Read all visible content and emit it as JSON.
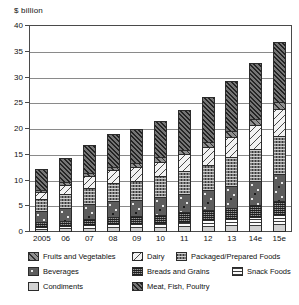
{
  "chart_data": {
    "type": "bar",
    "stacked": true,
    "title": "",
    "ylabel": "$ billion",
    "xlabel": "",
    "ylim": [
      0,
      40
    ],
    "yticks": [
      0,
      5,
      10,
      15,
      20,
      25,
      30,
      35,
      40
    ],
    "grid": true,
    "legend_position": "bottom",
    "categories": [
      "2005",
      "06",
      "07",
      "08",
      "09",
      "10",
      "11",
      "12",
      "13",
      "14e",
      "15e"
    ],
    "series": [
      {
        "name": "Condiments",
        "pattern": "solid-light-grey",
        "values": [
          0.4,
          0.5,
          0.6,
          0.7,
          0.7,
          0.8,
          0.9,
          1.0,
          1.1,
          1.2,
          1.4
        ]
      },
      {
        "name": "Snack Foods",
        "pattern": "horizontal-lines",
        "values": [
          0.5,
          0.6,
          0.7,
          0.8,
          0.9,
          1.0,
          1.1,
          1.3,
          1.5,
          1.7,
          2.0
        ]
      },
      {
        "name": "Breads and Grains",
        "pattern": "dense-cross-hatch-dark",
        "values": [
          1.0,
          1.1,
          1.3,
          1.4,
          1.5,
          1.6,
          1.8,
          1.9,
          2.1,
          2.3,
          2.6
        ]
      },
      {
        "name": "Beverages",
        "pattern": "dark-with-dots",
        "values": [
          2.1,
          2.4,
          2.8,
          3.1,
          3.2,
          3.4,
          3.6,
          3.9,
          4.3,
          4.7,
          5.3
        ]
      },
      {
        "name": "Packaged/Prepared Foods",
        "pattern": "mid-grey-cross-dots",
        "values": [
          2.4,
          2.8,
          3.2,
          3.5,
          3.7,
          4.0,
          4.4,
          4.9,
          5.5,
          6.3,
          7.3
        ]
      },
      {
        "name": "Dairy",
        "pattern": "white-back-diagonal",
        "values": [
          1.4,
          1.8,
          2.2,
          2.5,
          2.7,
          2.9,
          3.3,
          3.5,
          3.9,
          4.5,
          5.2
        ]
      },
      {
        "name": "Fruits and Vegetables",
        "pattern": "grey-forward-diagonal",
        "values": [
          0.4,
          0.5,
          0.6,
          0.7,
          0.8,
          0.8,
          0.9,
          1.0,
          1.2,
          1.3,
          1.5
        ]
      },
      {
        "name": "Meat, Fish, Poultry",
        "pattern": "dark-dense-diagonal",
        "values": [
          4.1,
          4.7,
          5.6,
          6.3,
          6.5,
          7.1,
          7.7,
          8.8,
          9.8,
          10.9,
          11.7
        ]
      }
    ],
    "totals": [
      12.3,
      14.4,
      17.0,
      19.0,
      20.0,
      21.6,
      23.7,
      26.3,
      29.4,
      32.9,
      37.0
    ]
  },
  "legend": {
    "rows": [
      [
        {
          "label": "Fruits and Vegetables",
          "key": "fruits"
        },
        {
          "label": "Dairy",
          "key": "dairy"
        },
        {
          "label": "Packaged/Prepared Foods",
          "key": "packaged"
        }
      ],
      [
        {
          "label": "Beverages",
          "key": "beverages"
        },
        {
          "label": "Breads and Grains",
          "key": "breads"
        },
        {
          "label": "Snack Foods",
          "key": "snack"
        }
      ],
      [
        {
          "label": "Condiments",
          "key": "condiments"
        },
        {
          "label": "Meat, Fish, Poultry",
          "key": "meat"
        }
      ]
    ]
  }
}
